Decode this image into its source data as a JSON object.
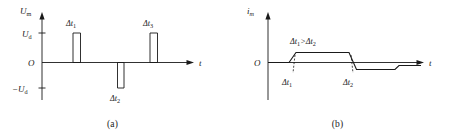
{
  "figure": {
    "panels": [
      {
        "id": "a",
        "caption": "(a)",
        "yaxis": {
          "label": "U",
          "label_sub": "m"
        },
        "xaxis": {
          "label": "t"
        },
        "origin_label": "O",
        "ticks": [
          {
            "name": "positive",
            "label": "U",
            "label_sub": "d",
            "value": 1
          },
          {
            "name": "negative",
            "label": "−U",
            "label_sub": "d",
            "value": -1
          }
        ],
        "pulses": [
          {
            "name": "pulse-1",
            "label": "Δt",
            "label_sub": "1",
            "polarity": "positive",
            "amplitude": 1,
            "label_position": "above"
          },
          {
            "name": "pulse-2",
            "label": "Δt",
            "label_sub": "2",
            "polarity": "negative",
            "amplitude": -1,
            "label_position": "below"
          },
          {
            "name": "pulse-3",
            "label": "Δt",
            "label_sub": "3",
            "polarity": "positive",
            "amplitude": 1,
            "label_position": "above"
          }
        ]
      },
      {
        "id": "b",
        "caption": "(b)",
        "yaxis": {
          "label": "i",
          "label_sub": "m"
        },
        "xaxis": {
          "label": "t"
        },
        "origin_label": "O",
        "annotation": {
          "lhs": "Δt",
          "lhs_sub": "1",
          "operator": ">",
          "rhs": "Δt",
          "rhs_sub": "2"
        },
        "interval_labels": [
          {
            "name": "interval-1",
            "label": "Δt",
            "label_sub": "1"
          },
          {
            "name": "interval-2",
            "label": "Δt",
            "label_sub": "2"
          }
        ]
      }
    ]
  },
  "style": {
    "stroke": "#1a1a1a",
    "text": "#1a1a1a",
    "background": "#ffffff"
  }
}
